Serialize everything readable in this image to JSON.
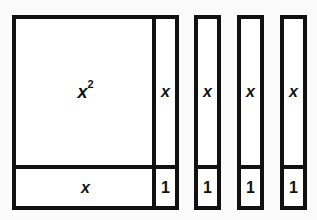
{
  "figure": {
    "kind": "algebra-tiles-area-model",
    "background_color": "#fbfbfb",
    "tile_fill_color": "#ffffff",
    "tile_border_color": "#111111",
    "labels": {
      "x_squared_base": "x",
      "x_squared_exponent": "2",
      "x_row": "x",
      "x_column_0": "x",
      "x_column_1": "x",
      "x_column_2": "x",
      "x_column_3": "x",
      "unit_0": "1",
      "unit_1": "1",
      "unit_2": "1",
      "unit_3": "1"
    }
  },
  "chart_data": {
    "type": "table",
    "title": "",
    "xlabel": "",
    "ylabel": "",
    "tiles": [
      {
        "name": "x-squared-tile",
        "label": "x²",
        "count": 1,
        "row": "top",
        "column": "large"
      },
      {
        "name": "x-tile-vertical",
        "label": "x",
        "count": 4,
        "row": "top",
        "column": "narrow"
      },
      {
        "name": "x-tile-horizontal",
        "label": "x",
        "count": 1,
        "row": "bottom",
        "column": "large"
      },
      {
        "name": "unit-tile",
        "label": "1",
        "count": 4,
        "row": "bottom",
        "column": "narrow"
      }
    ],
    "categories": [
      "x²",
      "x",
      "1"
    ],
    "values": [
      1,
      5,
      4
    ],
    "legend": []
  }
}
